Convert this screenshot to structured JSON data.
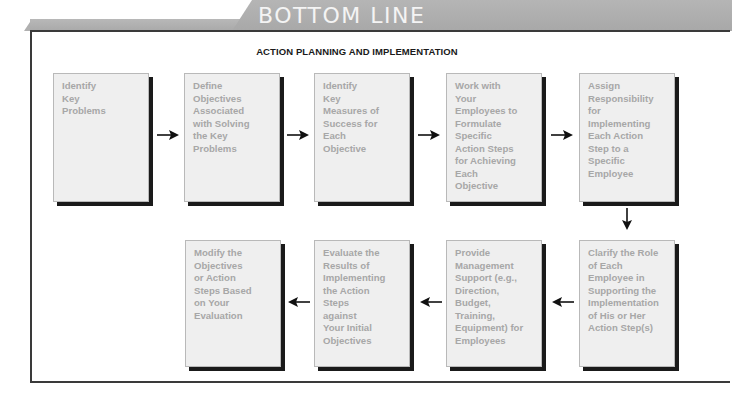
{
  "header": {
    "banner_title": "BOTTOM LINE"
  },
  "diagram": {
    "title": "ACTION PLANNING AND IMPLEMENTATION",
    "flow_direction": "left-to-right across top row, down on right, right-to-left across bottom row",
    "steps": [
      {
        "id": 1,
        "label": "Identify\nKey\nProblems"
      },
      {
        "id": 2,
        "label": "Define\nObjectives\nAssociated\nwith Solving\nthe Key\nProblems"
      },
      {
        "id": 3,
        "label": "Identify\nKey\nMeasures of\nSuccess for\nEach\nObjective"
      },
      {
        "id": 4,
        "label": "Work with\nYour\nEmployees to\nFormulate\nSpecific\nAction Steps\nfor Achieving\nEach\nObjective"
      },
      {
        "id": 5,
        "label": "Assign\nResponsibility\nfor\nImplementing\nEach Action\nStep to a\nSpecific\nEmployee"
      },
      {
        "id": 6,
        "label": "Clarify the Role\nof Each\nEmployee in\nSupporting the\nImplementation\nof His or Her\nAction Step(s)"
      },
      {
        "id": 7,
        "label": "Provide\nManagement\nSupport (e.g.,\nDirection,\nBudget,\nTraining,\nEquipment) for\nEmployees"
      },
      {
        "id": 8,
        "label": "Evaluate the\nResults of\nImplementing\nthe Action\nSteps\nagainst\nYour Initial\nObjectives"
      },
      {
        "id": 9,
        "label": "Modify the\nObjectives\nor Action\nSteps Based\non Your\nEvaluation"
      }
    ],
    "arrows": [
      {
        "from": 1,
        "to": 2,
        "direction": "right"
      },
      {
        "from": 2,
        "to": 3,
        "direction": "right"
      },
      {
        "from": 3,
        "to": 4,
        "direction": "right"
      },
      {
        "from": 4,
        "to": 5,
        "direction": "right"
      },
      {
        "from": 5,
        "to": 6,
        "direction": "down"
      },
      {
        "from": 6,
        "to": 7,
        "direction": "left"
      },
      {
        "from": 7,
        "to": 8,
        "direction": "left"
      },
      {
        "from": 8,
        "to": 9,
        "direction": "left"
      }
    ]
  },
  "colors": {
    "banner": "#adadad",
    "banner_text": "#f4f4f4",
    "box_fill": "#efefef",
    "box_text": "#a7a7a7",
    "box_shadow": "#1a1a1a",
    "frame_border": "#3a3a3a"
  }
}
